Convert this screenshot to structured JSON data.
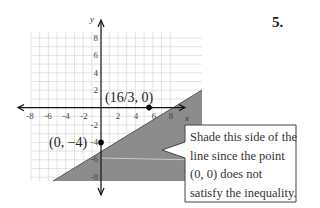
{
  "problem": {
    "number": "5."
  },
  "graph": {
    "x_axis_label": "x",
    "y_axis_label": "y",
    "x_ticks": [
      "-8",
      "-6",
      "-4",
      "-2",
      "2",
      "4",
      "6",
      "8"
    ],
    "y_ticks": [
      "8",
      "6",
      "4",
      "2",
      "-2",
      "-4",
      "-6",
      "-8"
    ],
    "points": [
      {
        "label": "(16/3, 0)",
        "x": 5.333,
        "y": 0
      },
      {
        "label": "(0, −4)",
        "x": 0,
        "y": -4
      }
    ],
    "shade_color": "#8c8c8c",
    "grid_color": "#d8d8d8"
  },
  "callout": {
    "lines": [
      "Shade this side of the",
      "line since the point",
      "(0, 0)  does not",
      "satisfy the inequality."
    ]
  }
}
